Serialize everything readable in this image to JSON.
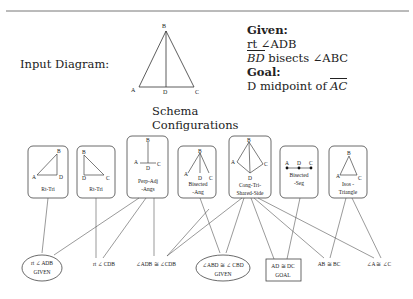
{
  "header": {
    "input_label": "Input Diagram:",
    "diagram_points": {
      "A": "A",
      "B": "B",
      "C": "C",
      "D": "D"
    }
  },
  "problem": {
    "given_heading": "Given:",
    "given_lines": [
      "rt ∠ADB",
      "BD",
      " bisects ∠ABC"
    ],
    "goal_heading": "Goal:",
    "goal_prefix": "D midpoint of ",
    "goal_segment": "AC"
  },
  "schema": {
    "title_line1": "Schema",
    "title_line2": "Configurations",
    "boxes": [
      {
        "label1": "Rt-Tri",
        "label2": "",
        "points": [
          "B",
          "A",
          "D"
        ]
      },
      {
        "label1": "Rt-Tri",
        "label2": "",
        "points": [
          "B",
          "D",
          "C"
        ]
      },
      {
        "label1": "Perp-Adj",
        "label2": "-Angs",
        "points": [
          "B",
          "A",
          "C",
          "D"
        ]
      },
      {
        "label1": "Bisected",
        "label2": "-Ang",
        "points": [
          "B",
          "A",
          "D",
          "C"
        ]
      },
      {
        "label1": "Cong-Tri-",
        "label2": "Shared-Side",
        "points": [
          "B",
          "A",
          "C",
          "D"
        ]
      },
      {
        "label1": "Bisected",
        "label2": "-Seg",
        "points": [
          "A",
          "D",
          "C"
        ]
      },
      {
        "label1": "Isos -",
        "label2": "Triangle",
        "points": [
          "B",
          "A",
          "C"
        ]
      }
    ]
  },
  "facts": [
    {
      "text": "rt ∠ ADB",
      "sub": "GIVEN",
      "shape": "ellipse"
    },
    {
      "text": "rt ∠ CDB",
      "sub": "",
      "shape": "none"
    },
    {
      "text": "∠ADB ≅ ∠CDB",
      "sub": "",
      "shape": "none"
    },
    {
      "text": "∠ABD ≅ ∠ CBD",
      "sub": "GIVEN",
      "shape": "ellipse"
    },
    {
      "text": "AD ≅ DC",
      "sub": "GOAL",
      "shape": "rect"
    },
    {
      "text": "AB ≅ BC",
      "sub": "",
      "shape": "none"
    },
    {
      "text": "∠A ≅ ∠C",
      "sub": "",
      "shape": "none"
    }
  ],
  "colors": {
    "line": "#555555",
    "text": "#222222",
    "rule": "#666666"
  }
}
